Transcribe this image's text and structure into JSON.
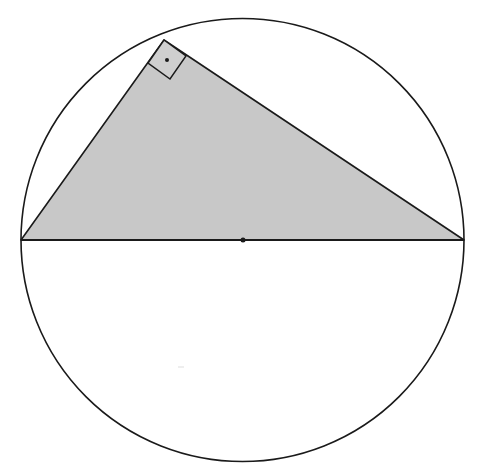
{
  "diagram": {
    "colors": {
      "background": "#ffffff",
      "stroke": "#1a1a1a",
      "triangle_fill": "#c8c8c8",
      "square_fill": "#cfcfcf"
    },
    "circle": {
      "cx": 242.5,
      "cy": 240,
      "r": 221.5
    },
    "triangle": {
      "vertices": [
        {
          "name": "left-endpoint",
          "x": 21,
          "y": 240
        },
        {
          "name": "apex",
          "x": 164,
          "y": 40
        },
        {
          "name": "right-endpoint",
          "x": 464,
          "y": 240
        }
      ]
    },
    "diameter": {
      "x1": 21,
      "y1": 240,
      "x2": 464,
      "y2": 240
    },
    "center_dot": {
      "x": 243,
      "y": 240,
      "r": 2.5
    },
    "right_angle_marker": {
      "points": [
        {
          "x": 164,
          "y": 40
        },
        {
          "x": 186,
          "y": 56
        },
        {
          "x": 170,
          "y": 79
        },
        {
          "x": 148,
          "y": 63
        }
      ],
      "dot": {
        "x": 167,
        "y": 60,
        "r": 2
      }
    },
    "artifact_mark": {
      "x1": 178,
      "y1": 367,
      "x2": 184,
      "y2": 367,
      "color": "#dddddd"
    }
  }
}
